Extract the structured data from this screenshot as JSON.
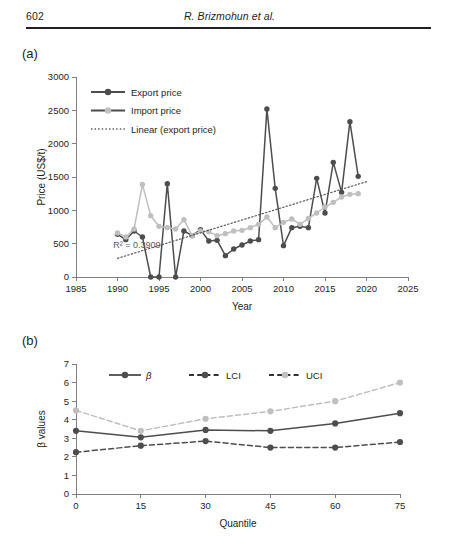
{
  "header": {
    "folio": "602",
    "running_title": "R. Brizmohun et al."
  },
  "panels": {
    "a_label": "(a)",
    "b_label": "(b)"
  },
  "colors": {
    "dark_series": "#4d4d4d",
    "light_series": "#bfbfbf",
    "axis": "#7f7f7f",
    "text": "#231f20",
    "annotation": "#595959"
  },
  "chart_data": [
    {
      "id": "panel-a",
      "type": "line",
      "title": "",
      "xlabel": "Year",
      "ylabel": "Price (US$/t)",
      "xlim": [
        1985,
        2025
      ],
      "ylim": [
        0,
        3000
      ],
      "xticks": [
        1985,
        1990,
        1995,
        2000,
        2005,
        2010,
        2015,
        2020,
        2025
      ],
      "yticks": [
        0,
        500,
        1000,
        1500,
        2000,
        2500,
        3000
      ],
      "grid": false,
      "legend_position": "top-left-inside",
      "annotations": [
        {
          "text": "R² = 0.3909",
          "x": 1989.5,
          "y": 430
        }
      ],
      "x": [
        1990,
        1991,
        1992,
        1993,
        1994,
        1995,
        1996,
        1997,
        1998,
        1999,
        2000,
        2001,
        2002,
        2003,
        2004,
        2005,
        2006,
        2007,
        2008,
        2009,
        2010,
        2011,
        2012,
        2013,
        2014,
        2015,
        2016,
        2017,
        2018,
        2019
      ],
      "series": [
        {
          "name": "Export price",
          "marker": "circle",
          "color": "#4d4d4d",
          "linestyle": "solid",
          "values": [
            640,
            560,
            690,
            600,
            0,
            0,
            1400,
            0,
            690,
            620,
            710,
            540,
            550,
            320,
            420,
            480,
            540,
            560,
            2520,
            1330,
            470,
            740,
            760,
            740,
            1480,
            960,
            1720,
            1270,
            2330,
            1510
          ]
        },
        {
          "name": "Import price",
          "marker": "circle",
          "color": "#bfbfbf",
          "linestyle": "solid",
          "values": [
            660,
            600,
            720,
            1390,
            920,
            760,
            740,
            720,
            860,
            620,
            690,
            680,
            620,
            650,
            690,
            700,
            740,
            790,
            900,
            740,
            820,
            870,
            790,
            880,
            960,
            1050,
            1120,
            1200,
            1240,
            1250
          ]
        },
        {
          "name": "Linear (export price)",
          "marker": "none",
          "color": "#595959",
          "linestyle": "dotted",
          "trend": true,
          "x_endpoints": [
            1990,
            2020
          ],
          "y_endpoints": [
            280,
            1430
          ],
          "r_squared": 0.3909
        }
      ]
    },
    {
      "id": "panel-b",
      "type": "line",
      "title": "",
      "xlabel": "Quantile",
      "ylabel": "β values",
      "xlim": [
        0,
        75
      ],
      "ylim": [
        0,
        7
      ],
      "xticks": [
        0,
        15,
        30,
        45,
        60,
        75
      ],
      "yticks": [
        0,
        1,
        2,
        3,
        4,
        5,
        6,
        7
      ],
      "grid": false,
      "legend_position": "top-center-inside",
      "x": [
        0,
        15,
        30,
        45,
        60,
        75
      ],
      "series": [
        {
          "name": "β",
          "marker": "circle",
          "color": "#4d4d4d",
          "linestyle": "solid",
          "values": [
            3.4,
            3.05,
            3.45,
            3.4,
            3.8,
            4.35
          ]
        },
        {
          "name": "LCI",
          "marker": "circle",
          "color": "#4d4d4d",
          "linestyle": "dashed",
          "values": [
            2.25,
            2.6,
            2.85,
            2.5,
            2.5,
            2.8
          ]
        },
        {
          "name": "UCI",
          "marker": "circle",
          "color": "#bfbfbf",
          "linestyle": "dashed",
          "values": [
            4.5,
            3.4,
            4.05,
            4.45,
            5.0,
            6.0
          ]
        }
      ]
    }
  ]
}
